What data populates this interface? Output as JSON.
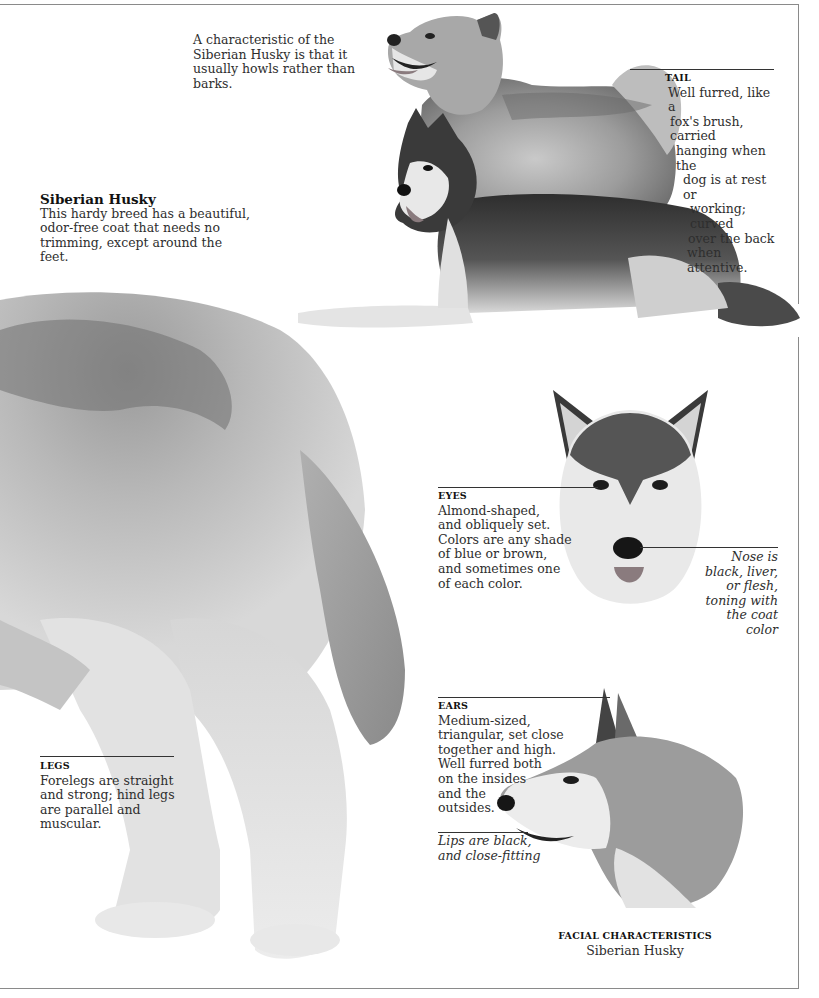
{
  "page": {
    "intro_caption": "A characteristic of the Siberian Husky is that it usually howls rather than barks.",
    "breed": {
      "title": "Siberian Husky",
      "description": "This hardy breed has a beautiful, odor-free coat that needs no trimming, except around the feet."
    },
    "annotations": {
      "tail": {
        "heading": "TAIL",
        "lines": [
          "Well furred, like a",
          "fox's brush, carried",
          "hanging when the",
          "dog is at rest or",
          "working; curved",
          "over the back",
          "when attentive."
        ]
      },
      "eyes": {
        "heading": "EYES",
        "lines": [
          "Almond-shaped,",
          "and obliquely set.",
          "Colors are any shade",
          "of blue or brown,",
          "and sometimes one",
          "of each color."
        ]
      },
      "nose": {
        "lines": [
          "Nose is",
          "black, liver,",
          "or flesh,",
          "toning with",
          "the coat",
          "color"
        ]
      },
      "ears": {
        "heading": "EARS",
        "lines": [
          "Medium-sized,",
          "triangular, set close",
          "together and high.",
          "Well furred both",
          "on the insides",
          "and the",
          "outsides."
        ]
      },
      "lips": {
        "lines": [
          "Lips are black,",
          "and close-fitting"
        ]
      },
      "legs": {
        "heading": "LEGS",
        "lines": [
          "Forelegs are straight",
          "and strong; hind legs",
          "are parallel and",
          "muscular."
        ]
      }
    },
    "facial_caption": {
      "heading": "FACIAL CHARACTERISTICS",
      "subtitle": "Siberian Husky"
    },
    "images": [
      {
        "name": "standing-husky-photo",
        "description": "Grey and white Siberian Husky standing, howling pose"
      },
      {
        "name": "lying-husky-photo",
        "description": "Black and white Siberian Husky lying down"
      },
      {
        "name": "hindquarters-photo",
        "description": "Close-up of husky hindquarters, hind legs and tail"
      },
      {
        "name": "front-face-photo",
        "description": "Front view of husky head"
      },
      {
        "name": "profile-head-photo",
        "description": "Side profile of husky head"
      }
    ],
    "colors": {
      "rule": "#333333",
      "frame": "#8a8a8a",
      "text": "#2e2e2e",
      "tongue": "#8a7b7e"
    }
  }
}
